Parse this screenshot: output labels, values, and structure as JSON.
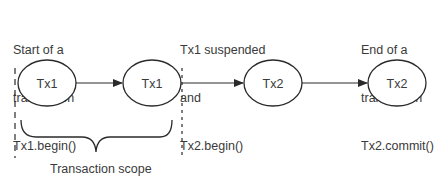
{
  "annotations": {
    "start": [
      "Start of a",
      "transaction",
      "Tx1.begin()"
    ],
    "suspend": [
      "Tx1 suspended",
      "and",
      "Tx2.begin()"
    ],
    "end": [
      "End of a",
      "transaction",
      "Tx2.commit()"
    ]
  },
  "nodes": [
    {
      "id": "n1",
      "label": "Tx1"
    },
    {
      "id": "n2",
      "label": "Tx1"
    },
    {
      "id": "n3",
      "label": "Tx2"
    },
    {
      "id": "n4",
      "label": "Tx2"
    }
  ],
  "scope_label": "Transaction scope",
  "colors": {
    "stroke": "#2a2a2a",
    "text": "#3a3a3a",
    "background": "#ffffff"
  }
}
